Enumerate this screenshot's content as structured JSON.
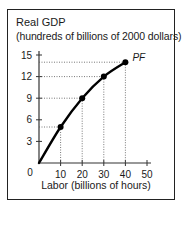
{
  "chart": {
    "title": "Real GDP",
    "subtitle": "(hundreds of billions of 2000 dollars)",
    "xlabel": "Labor (billions of hours)",
    "curve_label": "PF",
    "origin_label": "0",
    "colors": {
      "line": "#000000",
      "axis": "#333333",
      "guide": "#555555",
      "frame": "#222222"
    }
  },
  "chart_data": {
    "type": "line",
    "xlabel": "Labor (billions of hours)",
    "ylabel": "Real GDP (hundreds of billions of 2000 dollars)",
    "x_ticks": [
      10,
      20,
      30,
      40,
      50
    ],
    "y_ticks": [
      3,
      6,
      9,
      12,
      15
    ],
    "xlim": [
      0,
      50
    ],
    "ylim": [
      0,
      15
    ],
    "grid": false,
    "guide_lines": "dotted lines from each marked point to both axes",
    "series": [
      {
        "name": "PF",
        "x": [
          0,
          10,
          20,
          30,
          40
        ],
        "y": [
          0,
          5,
          9,
          12,
          14
        ],
        "markers": [
          false,
          true,
          true,
          true,
          true
        ]
      }
    ]
  }
}
